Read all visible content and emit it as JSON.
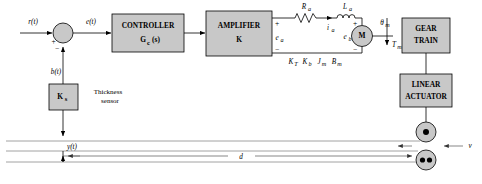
{
  "diagram": {
    "colors": {
      "block_fill": "#c8c8c8",
      "stroke": "#000000",
      "strip": "#8a8a8a",
      "background": "#ffffff"
    },
    "blocks": {
      "controller": {
        "line1": "CONTROLLER",
        "line2": "G",
        "line2_sub": "c",
        "line2_tail": "(s)"
      },
      "amplifier": {
        "line1": "AMPLIFIER",
        "line2": "K"
      },
      "gear_train": {
        "line1": "GEAR",
        "line2": "TRAIN"
      },
      "linear_actuator": {
        "line1": "LINEAR",
        "line2": "ACTUATOR"
      },
      "sensor_gain": {
        "label": "K",
        "sub": "s"
      },
      "motor": {
        "label": "M"
      }
    },
    "labels": {
      "reference": "r(t)",
      "error": "e(t)",
      "feedback": "b(t)",
      "sensor_name_line1": "Thickness",
      "sensor_name_line2": "sensor",
      "armature_resistance": "R",
      "armature_resistance_sub": "a",
      "armature_inductance": "L",
      "armature_inductance_sub": "a",
      "armature_current": "i",
      "armature_current_sub": "a",
      "armature_voltage": "e",
      "armature_voltage_sub": "a",
      "back_emf": "e",
      "back_emf_sub": "b",
      "motor_angle": "θ",
      "motor_angle_sub": "m",
      "motor_torque": "T",
      "motor_torque_sub": "m",
      "motor_params": "Kᴛ  Kʙ  Jₘ  Bₘ",
      "motor_params_plain": "KT Kb Jm Bm",
      "output_thickness": "y(t)",
      "distance": "d",
      "velocity": "v",
      "sum_plus": "+",
      "sum_minus": "−"
    },
    "motor_parameter_terms": [
      {
        "sym": "K",
        "sub": "T"
      },
      {
        "sym": "K",
        "sub": "b"
      },
      {
        "sym": "J",
        "sub": "m"
      },
      {
        "sym": "B",
        "sub": "m"
      }
    ]
  }
}
